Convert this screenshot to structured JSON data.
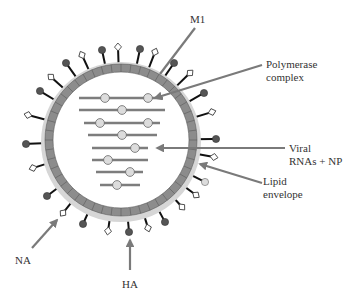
{
  "colors": {
    "background": "#ffffff",
    "arrow": "#7a7a7a",
    "membrane_fill": "#8c8c8c",
    "membrane_halo": "#d6d6d6",
    "membrane_segment_line": "#5a5a5a",
    "spike_stem": "#111111",
    "ha_head": "#555555",
    "na_head": "#ffffff",
    "rna_line": "#7d7d7d",
    "np_fill": "#dcdcdc",
    "label": "#333333"
  },
  "labels": {
    "m1": "M1",
    "polymerase_line1": "Polymerase",
    "polymerase_line2": "complex",
    "viral_line1": "Viral",
    "viral_line2": "RNAs + NP",
    "lipid_line1": "Lipid",
    "lipid_line2": "envelope",
    "na": "NA",
    "ha": "HA"
  },
  "virion": {
    "cx": 121,
    "cy": 140,
    "outer_r": 76,
    "inner_r": 68,
    "segments": 48
  },
  "spikes": [
    {
      "type": "HA",
      "x": 66,
      "y": 63
    },
    {
      "type": "NA",
      "x": 82,
      "y": 55
    },
    {
      "type": "HA",
      "x": 102,
      "y": 50
    },
    {
      "type": "NA",
      "x": 118,
      "y": 47
    },
    {
      "type": "HA",
      "x": 140,
      "y": 49
    },
    {
      "type": "NA",
      "x": 155,
      "y": 52
    },
    {
      "type": "HA",
      "x": 174,
      "y": 63
    },
    {
      "type": "NA",
      "x": 190,
      "y": 73
    },
    {
      "type": "HA",
      "x": 204,
      "y": 93
    },
    {
      "type": "NA",
      "x": 212,
      "y": 112
    },
    {
      "type": "HA",
      "x": 216,
      "y": 139
    },
    {
      "type": "NA",
      "x": 214,
      "y": 157
    },
    {
      "type": "HA-light",
      "x": 205,
      "y": 182
    },
    {
      "type": "NA",
      "x": 196,
      "y": 195
    },
    {
      "type": "NA",
      "x": 182,
      "y": 207
    },
    {
      "type": "HA",
      "x": 165,
      "y": 222
    },
    {
      "type": "NA",
      "x": 148,
      "y": 228
    },
    {
      "type": "HA",
      "x": 129,
      "y": 232
    },
    {
      "type": "NA",
      "x": 108,
      "y": 231
    },
    {
      "type": "HA",
      "x": 83,
      "y": 224
    },
    {
      "type": "NA",
      "x": 63,
      "y": 213
    },
    {
      "type": "HA",
      "x": 47,
      "y": 196
    },
    {
      "type": "NA",
      "x": 33,
      "y": 168
    },
    {
      "type": "HA",
      "x": 26,
      "y": 144
    },
    {
      "type": "NA",
      "x": 28,
      "y": 115
    },
    {
      "type": "HA",
      "x": 40,
      "y": 91
    },
    {
      "type": "NA",
      "x": 51,
      "y": 77
    }
  ],
  "rna_segments": [
    {
      "y": 98,
      "x1": 79,
      "x2": 163,
      "nps": [
        105,
        148
      ]
    },
    {
      "y": 110,
      "x1": 79,
      "x2": 165,
      "nps": [
        122
      ]
    },
    {
      "y": 123,
      "x1": 84,
      "x2": 160,
      "nps": [
        100,
        148
      ]
    },
    {
      "y": 135,
      "x1": 88,
      "x2": 157,
      "nps": [
        122
      ]
    },
    {
      "y": 148,
      "x1": 92,
      "x2": 148,
      "nps": [
        135
      ]
    },
    {
      "y": 160,
      "x1": 92,
      "x2": 148,
      "nps": [
        108
      ]
    },
    {
      "y": 172,
      "x1": 96,
      "x2": 143,
      "nps": [
        130
      ]
    },
    {
      "y": 185,
      "x1": 100,
      "x2": 140,
      "nps": [
        117
      ]
    }
  ],
  "pointers": [
    {
      "name": "m1-pointer",
      "from": [
        195,
        28
      ],
      "to": [
        160,
        74
      ],
      "arrowhead": false
    },
    {
      "name": "polymerase-pointer",
      "from": [
        262,
        65
      ],
      "to": [
        155,
        98
      ],
      "arrowhead": true
    },
    {
      "name": "viral-rna-pointer",
      "from": [
        285,
        148
      ],
      "to": [
        157,
        148
      ],
      "arrowhead": true
    },
    {
      "name": "lipid-pointer",
      "from": [
        262,
        183
      ],
      "to": [
        200,
        164
      ],
      "arrowhead": true
    },
    {
      "name": "na-pointer",
      "from": [
        32,
        248
      ],
      "to": [
        57,
        220
      ],
      "arrowhead": true
    },
    {
      "name": "ha-pointer",
      "from": [
        130,
        270
      ],
      "to": [
        130,
        240
      ],
      "arrowhead": true
    }
  ]
}
